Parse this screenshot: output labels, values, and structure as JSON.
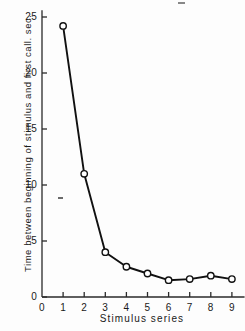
{
  "chart_data": {
    "type": "line",
    "title": "",
    "xlabel": "Stimulus  series",
    "ylabel": "Time between beginning of stimulus and first call. sec.",
    "x": [
      1,
      2,
      3,
      4,
      5,
      6,
      7,
      8,
      9
    ],
    "values": [
      24.2,
      11.0,
      4.0,
      2.7,
      2.1,
      1.5,
      1.6,
      1.9,
      1.6
    ],
    "series": [
      {
        "name": "Time to first call",
        "values": [
          24.2,
          11.0,
          4.0,
          2.7,
          2.1,
          1.5,
          1.6,
          1.9,
          1.6
        ]
      }
    ],
    "xlim": [
      0,
      9.6
    ],
    "ylim": [
      0,
      25.6
    ],
    "xticks": [
      0,
      1,
      2,
      3,
      4,
      5,
      6,
      7,
      8,
      9
    ],
    "xtick_labels": [
      "0",
      "1",
      "2",
      "3",
      "4",
      "5",
      "6",
      "7",
      "8",
      "9"
    ],
    "yticks": [
      0,
      5,
      10,
      15,
      20,
      25
    ],
    "ytick_labels": [
      "0",
      "5",
      "10",
      "15",
      "20",
      "25"
    ],
    "grid": false,
    "legend": null,
    "marker": "open-circle",
    "line_color": "#111111",
    "marker_fill": "#ffffff",
    "axis_color": "#2a2a2a"
  },
  "figure": {
    "background": "#fdfdfd",
    "artifact_mark": "scan-speck"
  }
}
